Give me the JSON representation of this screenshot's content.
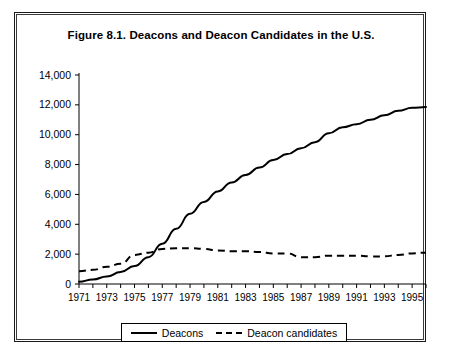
{
  "figure": {
    "title": "Figure 8.1.  Deacons and Deacon Candidates in the U.S."
  },
  "legend": {
    "items": [
      {
        "label": "Deacons",
        "style": "solid"
      },
      {
        "label": "Deacon candidates",
        "style": "dashed"
      }
    ]
  },
  "chart_data": {
    "type": "line",
    "title": "Figure 8.1.  Deacons and Deacon Candidates in the U.S.",
    "xlabel": "",
    "ylabel": "",
    "xlim": [
      1971,
      1996
    ],
    "ylim": [
      0,
      14000
    ],
    "grid": false,
    "legend_position": "bottom",
    "ytick_labels": [
      "0",
      "2,000",
      "4,000",
      "6,000",
      "8,000",
      "10,000",
      "12,000",
      "14,000"
    ],
    "ytick_values": [
      0,
      2000,
      4000,
      6000,
      8000,
      10000,
      12000,
      14000
    ],
    "xtick_values": [
      1971,
      1972,
      1973,
      1974,
      1975,
      1976,
      1977,
      1978,
      1979,
      1980,
      1981,
      1982,
      1983,
      1984,
      1985,
      1986,
      1987,
      1988,
      1989,
      1990,
      1991,
      1992,
      1993,
      1994,
      1995,
      1996
    ],
    "xtick_labels": [
      "1971",
      "1973",
      "1975",
      "1977",
      "1979",
      "1981",
      "1983",
      "1985",
      "1987",
      "1989",
      "1991",
      "1993",
      "1995"
    ],
    "xtick_labeled_values": [
      1971,
      1973,
      1975,
      1977,
      1979,
      1981,
      1983,
      1985,
      1987,
      1989,
      1991,
      1993,
      1995
    ],
    "x": [
      1971,
      1972,
      1973,
      1974,
      1975,
      1976,
      1977,
      1978,
      1979,
      1980,
      1981,
      1982,
      1983,
      1984,
      1985,
      1986,
      1987,
      1988,
      1989,
      1990,
      1991,
      1992,
      1993,
      1994,
      1995,
      1996
    ],
    "series": [
      {
        "name": "Deacons",
        "style": "solid",
        "values": [
          150,
          300,
          500,
          800,
          1200,
          1800,
          2700,
          3700,
          4700,
          5500,
          6200,
          6800,
          7300,
          7800,
          8300,
          8700,
          9100,
          9500,
          10100,
          10500,
          10700,
          11000,
          11300,
          11600,
          11800,
          11850
        ]
      },
      {
        "name": "Deacon candidates",
        "style": "dashed",
        "values": [
          850,
          950,
          1150,
          1350,
          1950,
          2100,
          2350,
          2400,
          2400,
          2350,
          2250,
          2200,
          2200,
          2150,
          2050,
          2050,
          1800,
          1800,
          1900,
          1900,
          1900,
          1850,
          1850,
          1950,
          2050,
          2100
        ]
      }
    ]
  }
}
